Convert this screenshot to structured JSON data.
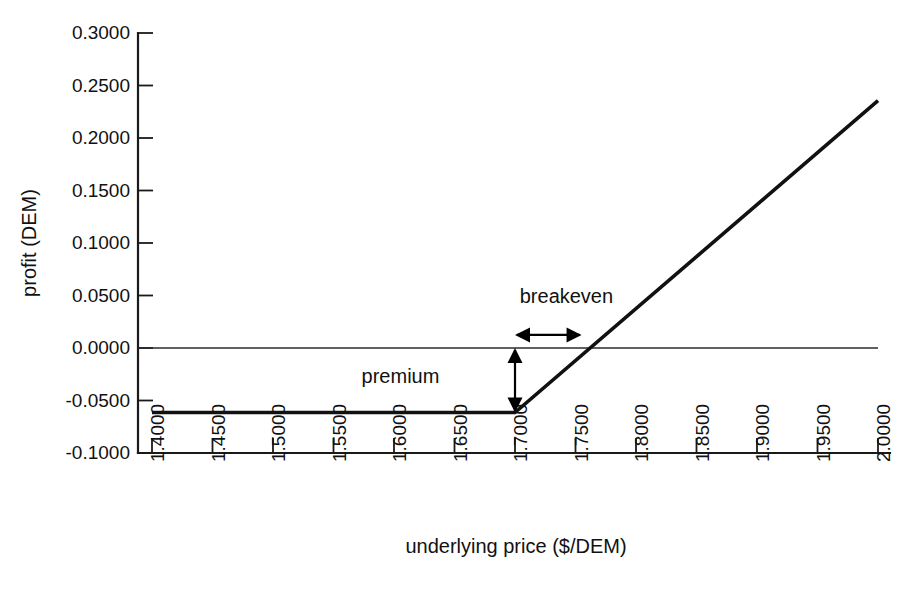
{
  "chart_data": {
    "type": "line",
    "title": "",
    "xlabel": "underlying price ($/DEM)",
    "ylabel": "profit (DEM)",
    "xlim": [
      1.4,
      2.0
    ],
    "ylim": [
      -0.1,
      0.3
    ],
    "grid": false,
    "legend": "none",
    "x_ticks": [
      "1.4000",
      "1.4500",
      "1.5000",
      "1.5500",
      "1.6000",
      "1.6500",
      "1.7000",
      "1.7500",
      "1.8000",
      "1.8500",
      "1.9000",
      "1.9500",
      "2.0000"
    ],
    "y_ticks": [
      "0.3000",
      "0.2500",
      "0.2000",
      "0.1500",
      "0.1000",
      "0.0500",
      "0.0000",
      "-0.0500",
      "-0.1000"
    ],
    "x_tick_values": [
      1.4,
      1.45,
      1.5,
      1.55,
      1.6,
      1.65,
      1.7,
      1.75,
      1.8,
      1.85,
      1.9,
      1.95,
      2.0
    ],
    "y_tick_values": [
      0.3,
      0.25,
      0.2,
      0.15,
      0.1,
      0.05,
      0.0,
      -0.05,
      -0.1
    ],
    "series": [
      {
        "name": "long call profit",
        "x": [
          1.4,
          1.7,
          2.0
        ],
        "values": [
          -0.0615,
          -0.0615,
          0.2355
        ]
      }
    ],
    "reference_lines": [
      {
        "name": "zero-profit-line",
        "axis": "y",
        "value": 0.0
      }
    ],
    "annotations": [
      {
        "label": "premium",
        "type": "vertical-double-arrow",
        "x": 1.7,
        "y_from": -0.0615,
        "y_to": 0.0,
        "value": 0.0615,
        "label_x": 1.6375,
        "label_y": -0.0335
      },
      {
        "label": "breakeven",
        "type": "horizontal-double-arrow",
        "y": 0.0125,
        "x_from": 1.7,
        "x_to": 1.755,
        "value": 0.0615,
        "label_x": 1.7425,
        "label_y": 0.0425
      }
    ],
    "colors": {
      "axis": "#1a1a1a",
      "payoff": "#111111",
      "zero_line": "#2b2b2b",
      "annotation": "#000000",
      "background": "#ffffff"
    },
    "strike": 1.7,
    "premium": 0.0615,
    "breakeven_price": 1.7615
  }
}
